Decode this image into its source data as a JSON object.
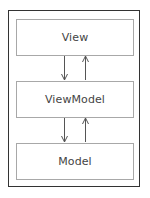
{
  "diagram": {
    "type": "layered-architecture",
    "layers": [
      {
        "label": "View"
      },
      {
        "label": "ViewModel"
      },
      {
        "label": "Model"
      }
    ],
    "connections": [
      {
        "from": "View",
        "to": "ViewModel",
        "direction": "down"
      },
      {
        "from": "ViewModel",
        "to": "View",
        "direction": "up"
      },
      {
        "from": "ViewModel",
        "to": "Model",
        "direction": "down"
      },
      {
        "from": "Model",
        "to": "ViewModel",
        "direction": "up"
      }
    ],
    "colors": {
      "outer_border": "#333333",
      "box_border": "#a8a8a8",
      "arrow": "#555555",
      "text": "#444444"
    }
  }
}
